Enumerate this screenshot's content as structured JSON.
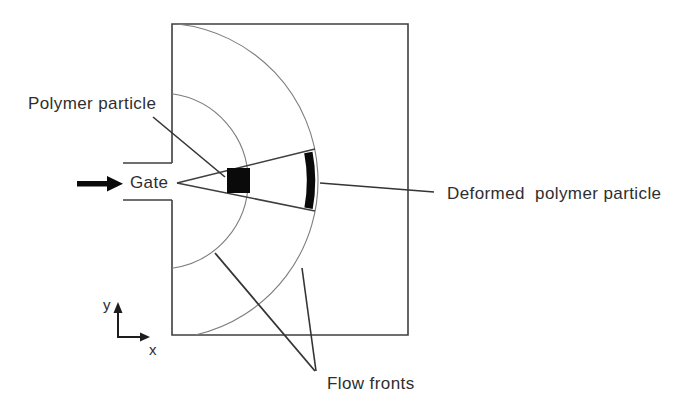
{
  "diagram": {
    "type": "injection-molding-schematic",
    "labels": {
      "polymer_particle": "Polymer particle",
      "gate": "Gate",
      "deformed_polymer_particle": "Deformed  polymer particle",
      "flow_fronts": "Flow fronts",
      "axis_y": "y",
      "axis_x": "x"
    },
    "colors": {
      "background": "#ffffff",
      "outline": "#3f3f3f",
      "flow_front_arc": "#7d7d7d",
      "leader_line": "#343434",
      "particle_fill": "#0a0a0a",
      "text": "#2e2e2e"
    }
  }
}
